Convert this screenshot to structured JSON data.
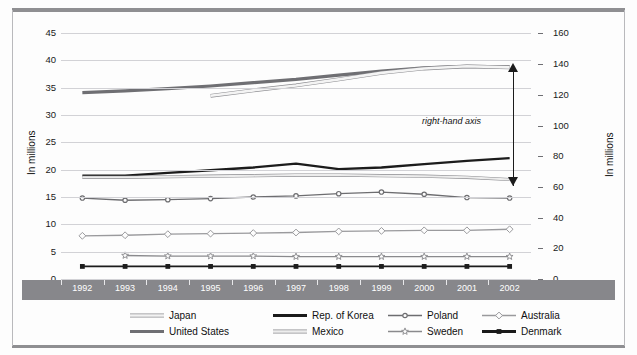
{
  "axes": {
    "left_title": "In millions",
    "right_title": "In millions",
    "left_ticks": [
      "0",
      "5",
      "10",
      "15",
      "20",
      "25",
      "30",
      "35",
      "40",
      "45"
    ],
    "right_ticks": [
      "0",
      "20",
      "40",
      "60",
      "80",
      "100",
      "120",
      "140",
      "160"
    ],
    "left_range": [
      0,
      47
    ],
    "right_range": [
      0,
      167.4
    ]
  },
  "annotation": {
    "text": "right-hand axis"
  },
  "legend": {
    "rows": [
      [
        {
          "name": "Japan",
          "style": "outline-thin",
          "color": "#f2f2f2",
          "marker": "none"
        },
        {
          "name": "Rep. of Korea",
          "style": "solid-thick",
          "color": "#1a1a1a",
          "marker": "none"
        },
        {
          "name": "Poland",
          "style": "solid-thin",
          "color": "#6d6d70",
          "marker": "circle-filled"
        },
        {
          "name": "Australia",
          "style": "solid-thin",
          "color": "#9a9a9d",
          "marker": "diamond-open"
        }
      ],
      [
        {
          "name": "United States",
          "style": "solid-thick",
          "color": "#6f6f73",
          "marker": "none"
        },
        {
          "name": "Mexico",
          "style": "outline-thin",
          "color": "#ededed",
          "marker": "none"
        },
        {
          "name": "Sweden",
          "style": "solid-thin",
          "color": "#8a8a8d",
          "marker": "star-open"
        },
        {
          "name": "Denmark",
          "style": "solid-thick",
          "color": "#1a1a1a",
          "marker": "square-filled"
        }
      ]
    ]
  },
  "chart_data": {
    "type": "line",
    "title": "",
    "xlabel": "",
    "ylabel": "In millions",
    "ylim": [
      0,
      47
    ],
    "y2lim": [
      0,
      167.4
    ],
    "grid": true,
    "legend_position": "bottom",
    "x": [
      "1992",
      "1993",
      "1994",
      "1995",
      "1996",
      "1997",
      "1998",
      "1999",
      "2000",
      "2001",
      "2002"
    ],
    "series": [
      {
        "name": "United States",
        "axis": "left",
        "color": "#6f6f73",
        "width": 3.2,
        "marker": "none",
        "values": [
          34.1,
          34.4,
          34.8,
          35.3,
          35.9,
          36.5,
          37.3,
          38.0,
          38.6,
          38.9,
          38.8
        ]
      },
      {
        "name": "Japan",
        "axis": "left",
        "color": "#f4f4f4",
        "width": 2.6,
        "marker": "none",
        "values": [
          null,
          null,
          null,
          33.5,
          34.5,
          35.4,
          36.5,
          37.7,
          38.5,
          38.9,
          38.7
        ]
      },
      {
        "name": "Rep. of Korea",
        "axis": "left",
        "color": "#1c1c1c",
        "width": 2.4,
        "marker": "none",
        "values": [
          18.9,
          18.9,
          19.4,
          19.9,
          20.4,
          21.1,
          20.1,
          20.4,
          21.0,
          21.6,
          22.1
        ]
      },
      {
        "name": "Mexico",
        "axis": "left",
        "color": "#ececec",
        "width": 2.0,
        "marker": "none",
        "values": [
          18.6,
          18.6,
          18.7,
          18.8,
          18.9,
          19.0,
          19.0,
          18.9,
          18.8,
          18.6,
          18.2
        ]
      },
      {
        "name": "Poland",
        "axis": "left",
        "color": "#6d6d70",
        "width": 1.3,
        "marker": "circle-filled",
        "values": [
          14.8,
          14.4,
          14.5,
          14.7,
          15.0,
          15.2,
          15.6,
          15.9,
          15.5,
          14.9,
          14.8
        ]
      },
      {
        "name": "Australia",
        "axis": "left",
        "color": "#9a9a9d",
        "width": 1.3,
        "marker": "diamond-open",
        "values": [
          7.9,
          8.0,
          8.2,
          8.3,
          8.4,
          8.5,
          8.7,
          8.8,
          8.9,
          8.9,
          9.1
        ]
      },
      {
        "name": "Sweden",
        "axis": "left",
        "color": "#8a8a8d",
        "width": 1.3,
        "marker": "star-open",
        "values": [
          null,
          4.3,
          4.2,
          4.2,
          4.2,
          4.1,
          4.1,
          4.1,
          4.1,
          4.1,
          4.1
        ]
      },
      {
        "name": "Denmark",
        "axis": "left",
        "color": "#1c1c1c",
        "width": 1.8,
        "marker": "square-filled",
        "values": [
          2.3,
          2.3,
          2.3,
          2.3,
          2.3,
          2.3,
          2.3,
          2.3,
          2.3,
          2.3,
          2.3
        ]
      }
    ]
  }
}
